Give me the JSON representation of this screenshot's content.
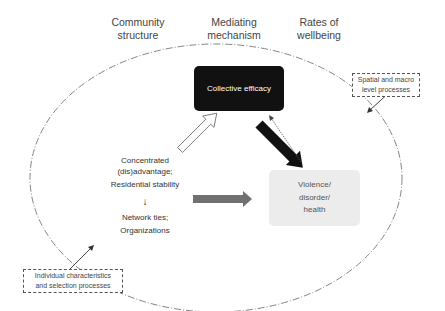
{
  "headers": {
    "community_structure": [
      "Community",
      "structure"
    ],
    "mediating_mechanism": [
      "Mediating",
      "mechanism"
    ],
    "rates_of_wellbeing": [
      "Rates of",
      "wellbeing"
    ]
  },
  "nodes": {
    "collective_efficacy": {
      "label": "Collective efficacy",
      "fill": "#111111",
      "text_color": "#ffffff"
    },
    "community_structure": {
      "lines": [
        "Concentrated",
        "(dis)advantage;",
        "Residential stability"
      ],
      "arrow": "↓",
      "lines2": [
        "Network ties;",
        "Organizations"
      ]
    },
    "outcomes": {
      "lines": [
        "Violence/",
        "disorder/",
        "health"
      ],
      "fill": "#ececec"
    }
  },
  "notes": {
    "macro": [
      "Spatial and macro",
      "level processes"
    ],
    "individual": [
      "Individual characteristics",
      "and selection processes"
    ]
  },
  "edges": [
    {
      "from": "community_structure",
      "to": "collective_efficacy",
      "style": "hollow-arrow"
    },
    {
      "from": "collective_efficacy",
      "to": "outcomes",
      "style": "thick-black-arrow"
    },
    {
      "from": "outcomes",
      "to": "collective_efficacy",
      "style": "thin-dashed-feedback-arrow"
    },
    {
      "from": "community_structure",
      "to": "outcomes",
      "style": "thick-gray-arrow"
    },
    {
      "from": "note_macro",
      "to": "boundary",
      "style": "thin-arrow"
    },
    {
      "from": "note_individual",
      "to": "boundary",
      "style": "thin-arrow"
    }
  ],
  "boundary": {
    "shape": "ellipse",
    "style": "dash-dot"
  },
  "colors": {
    "gray_arrow": "#707070",
    "black": "#111111",
    "outline": "#555555"
  }
}
